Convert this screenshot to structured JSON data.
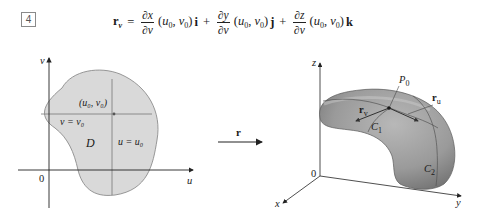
{
  "equation": {
    "number": "4",
    "lhs_symbol": "r",
    "lhs_sub": "v",
    "equals": "=",
    "terms": [
      {
        "num": "∂x",
        "den": "∂v",
        "args_u": "u",
        "args_u_sub": "0",
        "args_v": "v",
        "args_v_sub": "0",
        "unit": "i"
      },
      {
        "num": "∂y",
        "den": "∂v",
        "args_u": "u",
        "args_u_sub": "0",
        "args_v": "v",
        "args_v_sub": "0",
        "unit": "j"
      },
      {
        "num": "∂z",
        "den": "∂v",
        "args_u": "u",
        "args_u_sub": "0",
        "args_v": "v",
        "args_v_sub": "0",
        "unit": "k"
      }
    ],
    "plus": "+"
  },
  "domain_plot": {
    "axis_v_label": "v",
    "axis_u_label": "u",
    "origin_label": "0",
    "point_label": "(u₀, v₀)",
    "line_v_label": "v = v₀",
    "line_u_label": "u = u₀",
    "region_label": "D",
    "region_fill": "#d9d9d9",
    "region_stroke": "#8c8c8c"
  },
  "mapping_arrow": {
    "label": "r"
  },
  "surface_plot": {
    "axis_x_label": "x",
    "axis_y_label": "y",
    "axis_z_label": "z",
    "origin_label": "0",
    "point_label": "P",
    "point_sub": "0",
    "tangent_v_label": "r",
    "tangent_v_sub": "v",
    "tangent_u_label": "r",
    "tangent_u_sub": "u",
    "curve1_label": "C",
    "curve1_sub": "1",
    "curve2_label": "C",
    "curve2_sub": "2",
    "surface_color": "#9a9a9a"
  }
}
